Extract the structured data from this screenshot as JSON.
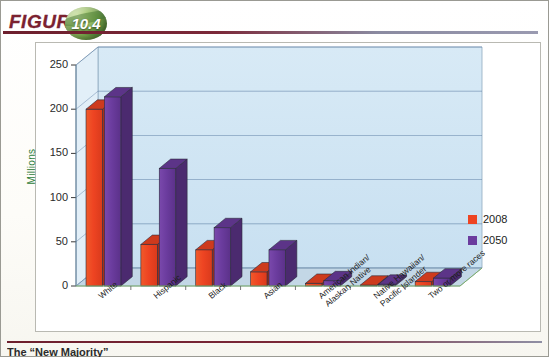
{
  "figure": {
    "word": "FIGURE",
    "number": "10.4"
  },
  "caption": "The “New Majority”",
  "legend": {
    "position": "right",
    "items": [
      {
        "label": "2008",
        "color": "#EE4422"
      },
      {
        "label": "2050",
        "color": "#6B3C9E"
      }
    ]
  },
  "colors": {
    "series_2008": "#EE4422",
    "series_2050": "#6B3C9E",
    "plot_wall": "#CFE4F2",
    "plot_floor": "#C3D7E6",
    "gridline": "#5878A0",
    "axis_title": "#2F7D3A",
    "rule": "#7B2838"
  },
  "chart_data": {
    "type": "bar",
    "title": "",
    "subtitle": "",
    "xlabel": "",
    "ylabel": "Millions",
    "ylim": [
      0,
      250
    ],
    "yticks": [
      0,
      50,
      100,
      150,
      200,
      250
    ],
    "grid": true,
    "threeD": true,
    "legend_position": "right",
    "categories": [
      "White",
      "Hispanic",
      "Black",
      "Asian",
      "American Indian/\nAlaskan Native",
      "Native Hawaiian/\nPacific Islander",
      "Two or more races"
    ],
    "series": [
      {
        "name": "2008",
        "color": "#EE4422",
        "values": [
          200,
          47,
          41,
          16,
          3,
          1,
          5
        ]
      },
      {
        "name": "2050",
        "color": "#6B3C9E",
        "values": [
          214,
          133,
          66,
          41,
          6,
          2,
          9
        ]
      }
    ]
  }
}
